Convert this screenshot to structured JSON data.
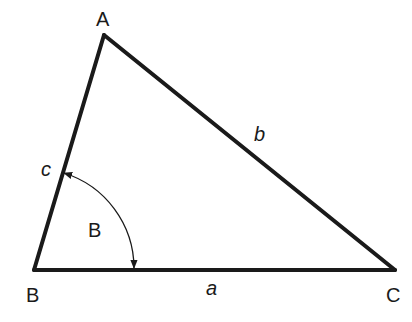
{
  "diagram": {
    "stroke_color": "#1a1a1a",
    "background": "#ffffff",
    "vertices": {
      "A": {
        "label": "A",
        "x": 104,
        "y": 35
      },
      "B": {
        "label": "B",
        "x": 34,
        "y": 270
      },
      "C": {
        "label": "C",
        "x": 395,
        "y": 270
      }
    },
    "sides": {
      "a": {
        "label": "a",
        "between": "B-C"
      },
      "b": {
        "label": "b",
        "between": "A-C"
      },
      "c": {
        "label": "c",
        "between": "A-B"
      }
    },
    "angle": {
      "label": "B",
      "at_vertex": "B",
      "arc_radius": 100,
      "arrowheads": "both ends"
    }
  }
}
